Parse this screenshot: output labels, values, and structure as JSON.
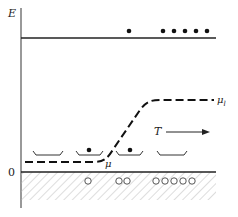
{
  "labels": {
    "energy_axis": "E",
    "zero": "0",
    "mu": "μ",
    "mu_l": "μ",
    "mu_l_sub": "l",
    "temperature": "T"
  },
  "colors": {
    "ink": "#222222",
    "hatch": "#bbbbbb",
    "background": "#ffffff"
  },
  "upper_level": {
    "y": 38,
    "filled_dots_x": [
      129,
      163,
      174,
      185,
      196,
      207
    ],
    "dots_y": 31
  },
  "lower_band": {
    "y": 172,
    "hatch_bottom": 200,
    "hollow_circles_x": [
      88,
      119,
      127,
      156,
      165,
      174,
      183,
      192
    ],
    "circles_y": 181
  },
  "traps": [
    {
      "x1": 33,
      "x2": 63,
      "dot": false
    },
    {
      "x1": 76,
      "x2": 103,
      "dot": true
    },
    {
      "x1": 116,
      "x2": 143,
      "dot": true
    },
    {
      "x1": 157,
      "x2": 187,
      "dot": false
    }
  ]
}
